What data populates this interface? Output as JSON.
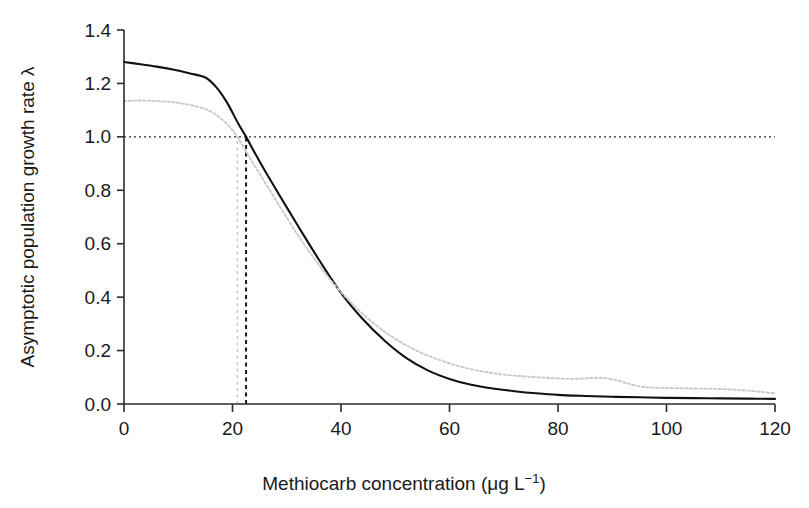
{
  "chart_data": {
    "type": "line",
    "title": "",
    "xlabel": "Methiocarb concentration (μg L⁻¹)",
    "xlabel_main": "Methiocarb concentration (μg L",
    "xlabel_sup": "−1",
    "xlabel_tail": ")",
    "ylabel": "Asymptotic population growth rate λ",
    "xlim": [
      0,
      120
    ],
    "ylim": [
      0.0,
      1.4
    ],
    "xticks": [
      0,
      20,
      40,
      60,
      80,
      100,
      120
    ],
    "xtick_labels": [
      "0",
      "20",
      "40",
      "60",
      "80",
      "100",
      "120"
    ],
    "yticks": [
      0.0,
      0.2,
      0.4,
      0.6,
      0.8,
      1.0,
      1.2,
      1.4
    ],
    "ytick_labels": [
      "0.0",
      "0.2",
      "0.4",
      "0.6",
      "0.8",
      "1.0",
      "1.2",
      "1.4"
    ],
    "grid": false,
    "legend": "none",
    "annotations": [
      {
        "name": "lambda-unity-reference",
        "type": "hline",
        "y": 1.0,
        "style": "dotted",
        "color": "#2b2b2b"
      },
      {
        "name": "solid-curve-threshold",
        "type": "vline",
        "x": 22.5,
        "y_from": 0.0,
        "y_to": 1.0,
        "style": "dashed",
        "color": "#1a1a1a"
      },
      {
        "name": "dotted-curve-threshold",
        "type": "vline",
        "x": 20.9,
        "y_from": 0.0,
        "y_to": 1.0,
        "style": "dotted",
        "color": "#c9c9c9"
      }
    ],
    "series": [
      {
        "name": "solid-curve",
        "label": "",
        "style": "solid",
        "color": "#111111",
        "x": [
          0,
          3,
          6,
          9,
          12,
          15,
          17,
          19,
          21,
          22.5,
          24,
          26,
          28,
          30,
          33,
          36,
          40,
          44,
          48,
          52,
          56,
          60,
          64,
          68,
          72,
          76,
          80,
          85,
          90,
          95,
          100,
          105,
          110,
          115,
          120
        ],
        "values": [
          1.28,
          1.272,
          1.263,
          1.252,
          1.238,
          1.222,
          1.186,
          1.128,
          1.052,
          1.0,
          0.944,
          0.872,
          0.804,
          0.736,
          0.636,
          0.538,
          0.416,
          0.318,
          0.238,
          0.173,
          0.126,
          0.094,
          0.072,
          0.058,
          0.048,
          0.04,
          0.034,
          0.03,
          0.027,
          0.025,
          0.023,
          0.022,
          0.021,
          0.02,
          0.019
        ]
      },
      {
        "name": "dotted-curve",
        "label": "",
        "style": "dotted",
        "color": "#c9c9c9",
        "x": [
          0,
          3,
          6,
          9,
          12,
          15,
          17,
          19,
          20.9,
          23,
          25,
          27,
          29,
          32,
          35,
          38,
          42,
          46,
          50,
          54,
          58,
          62,
          66,
          70,
          74,
          78,
          82,
          85,
          87,
          89,
          91,
          93,
          95,
          97,
          100,
          105,
          110,
          115,
          120
        ],
        "values": [
          1.134,
          1.136,
          1.134,
          1.13,
          1.12,
          1.104,
          1.082,
          1.048,
          1.0,
          0.928,
          0.862,
          0.796,
          0.73,
          0.634,
          0.546,
          0.466,
          0.376,
          0.302,
          0.244,
          0.199,
          0.166,
          0.14,
          0.122,
          0.11,
          0.103,
          0.098,
          0.094,
          0.096,
          0.098,
          0.096,
          0.088,
          0.076,
          0.066,
          0.062,
          0.06,
          0.058,
          0.056,
          0.05,
          0.04
        ]
      }
    ]
  },
  "figure": {
    "background_color": "#ffffff",
    "axis_color": "#2b2b2b"
  }
}
